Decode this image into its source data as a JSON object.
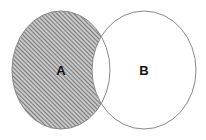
{
  "diagram": {
    "type": "venn",
    "shaded_region": "A minus B",
    "sets": [
      {
        "label": "A",
        "cx": 61,
        "cy": 70,
        "rx": 49,
        "ry": 59
      },
      {
        "label": "B",
        "cx": 144,
        "cy": 70,
        "rx": 52,
        "ry": 59
      }
    ],
    "colors": {
      "outline": "#888888",
      "hatch_dark": "#555555",
      "hatch_light": "#c8c8c8",
      "background": "#ffffff",
      "label": "#111111"
    }
  }
}
